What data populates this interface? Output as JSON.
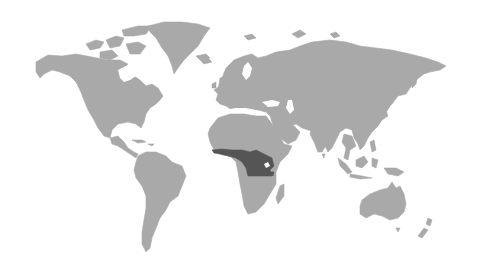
{
  "map": {
    "type": "world-choropleth",
    "colors": {
      "background": "#ffffff",
      "land": "#a9a9a9",
      "highlight": "#555555",
      "water": "#ffffff"
    },
    "highlighted_regions": [
      {
        "name": "Central Africa (Congo Basin)",
        "color": "#555555"
      }
    ]
  }
}
